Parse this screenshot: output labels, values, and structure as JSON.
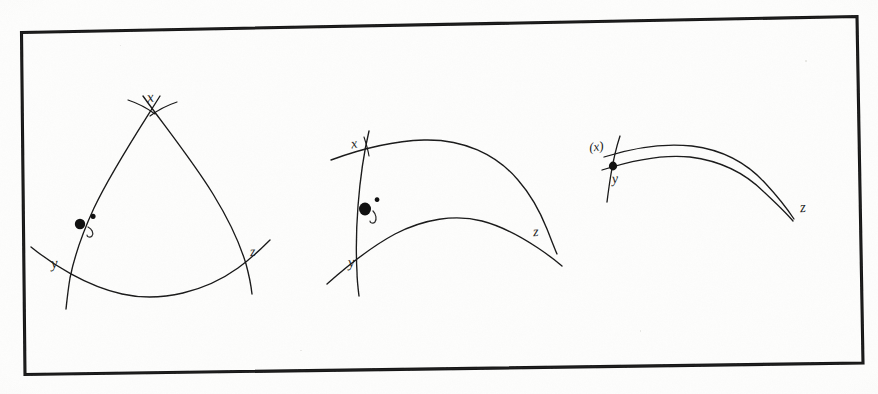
{
  "document": {
    "kind": "hand-drawn-figure-scan",
    "medium": "pen on paper, photocopied",
    "ink_color": "#1a1a1a",
    "paper_color": "#fdfdfc",
    "border": {
      "name": "rectangular-frame",
      "stroke_color": "#141414",
      "stroke_width_px": 3,
      "note": "slightly rotated / skewed as in a scan",
      "corners": {
        "top_left": [
          21,
          32
        ],
        "top_right": [
          857,
          16
        ],
        "bottom_right": [
          863,
          363
        ],
        "bottom_left": [
          25,
          374
        ]
      }
    }
  },
  "figures": [
    {
      "id": "figure-1",
      "name": "fat-geodesic-triangle",
      "caption": "",
      "vertices": [
        {
          "label": "x",
          "role": "apex-vertex",
          "x": 152,
          "y": 103
        },
        {
          "label": "y",
          "role": "lower-left-vertex",
          "x": 56,
          "y": 265
        },
        {
          "label": "z",
          "role": "lower-right-vertex",
          "x": 253,
          "y": 255
        }
      ],
      "marked_point": {
        "label": "p",
        "role": "point-on-side-xy",
        "x": 80,
        "y": 224,
        "dot_radius_px": 5
      },
      "sides": [
        {
          "name": "side-xy",
          "from": "x",
          "to": "y"
        },
        {
          "name": "side-xz",
          "from": "x",
          "to": "z"
        },
        {
          "name": "side-yz",
          "from": "y",
          "to": "z"
        }
      ]
    },
    {
      "id": "figure-2",
      "name": "thinner-geodesic-triangle",
      "caption": "",
      "vertices": [
        {
          "label": "x",
          "role": "upper-left-vertex",
          "x": 355,
          "y": 146
        },
        {
          "label": "y",
          "role": "lower-left-vertex",
          "x": 352,
          "y": 265
        },
        {
          "label": "z",
          "role": "right-vertex",
          "x": 537,
          "y": 235
        }
      ],
      "marked_point": {
        "label": "p",
        "role": "point-on-side-xy",
        "x": 365,
        "y": 209,
        "dot_radius_px": 6
      },
      "sides": [
        {
          "name": "side-xy",
          "from": "x",
          "to": "y"
        },
        {
          "name": "side-xz",
          "from": "x",
          "to": "z"
        },
        {
          "name": "side-yz",
          "from": "y",
          "to": "z"
        }
      ]
    },
    {
      "id": "figure-3",
      "name": "degenerate-thin-triangle",
      "caption": "",
      "vertices": [
        {
          "label": "(x)",
          "role": "collapsed-upper-vertex",
          "x": 597,
          "y": 148
        },
        {
          "label": "y",
          "role": "lower-left-vertex",
          "x": 615,
          "y": 181
        },
        {
          "label": "z",
          "role": "right-vertex",
          "x": 805,
          "y": 211
        }
      ],
      "marked_point": {
        "label": "p",
        "role": "point-on-collapsed-side",
        "x": 613,
        "y": 167,
        "dot_radius_px": 4
      },
      "sides": [
        {
          "name": "side-xz",
          "from": "(x)",
          "to": "z"
        },
        {
          "name": "side-yz",
          "from": "y",
          "to": "z"
        }
      ]
    }
  ],
  "labels": {
    "fig1_x": "x",
    "fig1_y": "y",
    "fig1_z": "z",
    "fig1_point": "p",
    "fig2_x": "x",
    "fig2_y": "y",
    "fig2_z": "z",
    "fig2_point": "p",
    "fig3_x": "(x)",
    "fig3_y": "y",
    "fig3_z": "z"
  }
}
